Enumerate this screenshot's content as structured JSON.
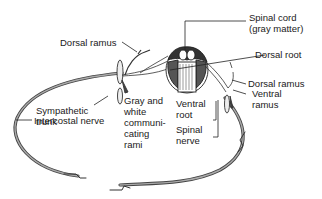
{
  "diagram": {
    "labels": {
      "spinal_cord": [
        "Spinal cord",
        "(gray matter)"
      ],
      "dorsal_root": "Dorsal root",
      "dorsal_ramus_left": "Dorsal ramus",
      "dorsal_ramus_right": "Dorsal ramus",
      "ventral_ramus": [
        "Ventral",
        "ramus"
      ],
      "sympathetic_trunk": [
        "Sympathetic",
        "trunk"
      ],
      "gray_white_rami": [
        "Gray and",
        "white",
        "communi-",
        "cating",
        "rami"
      ],
      "ventral_root": [
        "Ventral",
        "root"
      ],
      "spinal_nerve": [
        "Spinal",
        "nerve"
      ],
      "intercostal_nerve": "Intercostal nerve"
    },
    "colors": {
      "line": "#333333",
      "nerve_fill": "#9a9a9a",
      "text": "#1a1a1a"
    }
  }
}
